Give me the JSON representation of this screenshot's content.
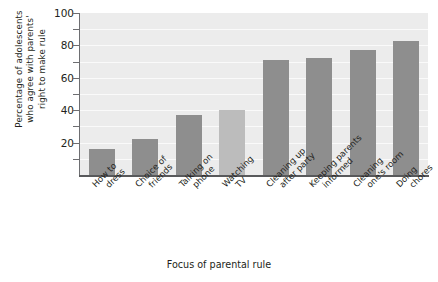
{
  "chart_data": {
    "type": "bar",
    "title": "",
    "xlabel": "Focus of parental rule",
    "ylabel_lines": [
      "Percentage of adolescents",
      "who agree with parents'",
      "right to make rule"
    ],
    "categories": [
      "How to dress",
      "Choice of friends",
      "Talking on phone",
      "Watching TV",
      "Cleaning up after party",
      "Keeping parents informed",
      "Cleaning one's room",
      "Doing chores"
    ],
    "category_lines": [
      [
        "How to",
        "dress"
      ],
      [
        "Choice of",
        "friends"
      ],
      [
        "Talking on",
        "phone"
      ],
      [
        "Watching",
        "TV"
      ],
      [
        "Cleaning up",
        "after party"
      ],
      [
        "Keeping parents",
        "informed"
      ],
      [
        "Cleaning",
        "one's room"
      ],
      [
        "Doing",
        "chores"
      ]
    ],
    "values": [
      16,
      22,
      37,
      40,
      71,
      72,
      77,
      83
    ],
    "bar_colors": [
      "#8e8e8e",
      "#8e8e8e",
      "#8e8e8e",
      "#bcbcbc",
      "#8e8e8e",
      "#8e8e8e",
      "#8e8e8e",
      "#8e8e8e"
    ],
    "ylim": [
      0,
      100
    ],
    "yticks": [
      0,
      20,
      40,
      60,
      80,
      100
    ],
    "ytick_labels": [
      "",
      "20",
      "40",
      "60",
      "80",
      "100"
    ],
    "yminor_ticks": [
      10,
      30,
      50,
      70,
      90
    ],
    "grid": true,
    "grid_axis": "y",
    "legend": "none",
    "plot_background": "#ececec",
    "axis_color": "#58595b"
  }
}
